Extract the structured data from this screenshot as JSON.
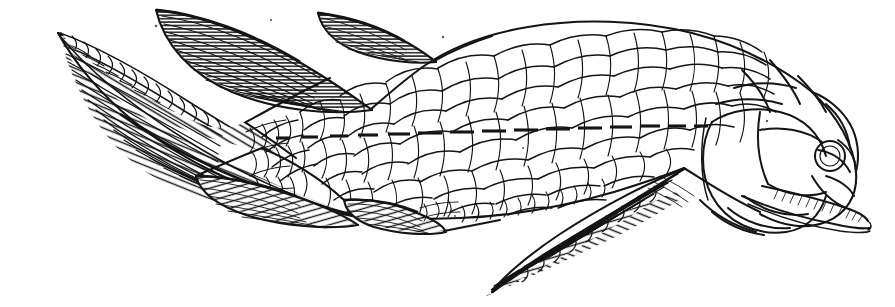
{
  "figure": {
    "kind": "scientific-engraving",
    "orientation": "head-right",
    "technique": "line-engraving with parallel-line hatching",
    "background_color": "#ffffff",
    "ink_color": "#141414",
    "canvas": {
      "width": 895,
      "height": 307
    }
  },
  "anatomy": {
    "parts": [
      {
        "name": "caudal-fin",
        "label": "caudal fin",
        "region": "left",
        "type": "heterocercal, two-lobed, densely hatched"
      },
      {
        "name": "first-dorsal-fin",
        "label": "first dorsal fin",
        "region": "upper-left",
        "type": "triangular, horizontally hatched"
      },
      {
        "name": "second-dorsal-fin",
        "label": "second dorsal fin",
        "region": "upper-centre",
        "type": "small, low, hatched"
      },
      {
        "name": "anal-fin",
        "label": "anal fin",
        "region": "lower-centre",
        "type": "small lobe, hatched"
      },
      {
        "name": "pelvic-fin",
        "label": "pelvic fin",
        "region": "lower-left-of-centre",
        "type": "rounded lobe, hatched"
      },
      {
        "name": "pectoral-fin",
        "label": "pectoral fin",
        "region": "lower-right",
        "type": "long tapering lobe, obliquely hatched"
      },
      {
        "name": "body-scales",
        "label": "rhombic body scales",
        "region": "trunk",
        "type": "large overlapping cycloid-rhombic scales in oblique rows"
      },
      {
        "name": "lateral-line",
        "label": "lateral line",
        "region": "mid-flank",
        "type": "row of short horizontal dashes"
      },
      {
        "name": "head-plates",
        "label": "dermal head plates",
        "region": "right",
        "type": "large polygonal bony plates"
      },
      {
        "name": "operculum",
        "label": "operculum",
        "region": "right",
        "type": "large oval gill cover plate"
      },
      {
        "name": "eye",
        "label": "orbit / eye",
        "region": "upper-right",
        "type": "small circular orbit"
      },
      {
        "name": "jaw",
        "label": "lower jaw with teeth",
        "region": "lower-right",
        "type": "elongate jaw, fine tooth hatching"
      },
      {
        "name": "snout",
        "label": "snout plates",
        "region": "far-right",
        "type": "rounded rostral plates"
      }
    ]
  },
  "counts": {
    "lateral_line_dashes": 24,
    "fins": 6,
    "dorsal_fins": 2
  },
  "caption": ""
}
